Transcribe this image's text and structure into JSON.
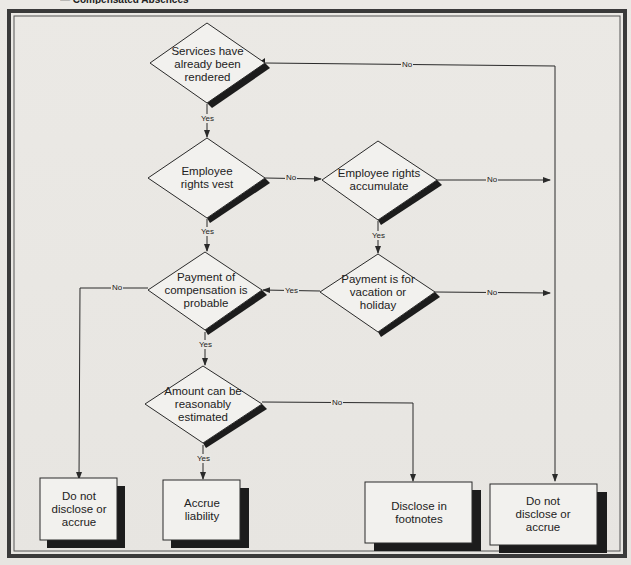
{
  "figure": {
    "title_partial": "— Compensated Absences"
  },
  "decisions": [
    {
      "id": "services-rendered",
      "label": "Services have already been rendered"
    },
    {
      "id": "rights-vest",
      "label": "Employee rights vest"
    },
    {
      "id": "rights-accumulate",
      "label": "Employee rights accumulate"
    },
    {
      "id": "vacation-holiday",
      "label": "Payment is for vacation or holiday"
    },
    {
      "id": "compensation-probable",
      "label": "Payment of compensation is probable"
    },
    {
      "id": "reasonably-estimated",
      "label": "Amount can be reasonably estimated"
    }
  ],
  "outcomes": [
    {
      "id": "do-not-disclose-left",
      "label": "Do not disclose or accrue"
    },
    {
      "id": "accrue-liability",
      "label": "Accrue liability"
    },
    {
      "id": "disclose-footnotes",
      "label": "Disclose in footnotes"
    },
    {
      "id": "do-not-disclose-right",
      "label": "Do not disclose or accrue"
    }
  ],
  "edges": [
    {
      "from": "services-rendered",
      "to": "do-not-disclose-right",
      "label": "No"
    },
    {
      "from": "services-rendered",
      "to": "rights-vest",
      "label": "Yes"
    },
    {
      "from": "rights-vest",
      "to": "rights-accumulate",
      "label": "No"
    },
    {
      "from": "rights-vest",
      "to": "compensation-probable",
      "label": "Yes"
    },
    {
      "from": "rights-accumulate",
      "to": "do-not-disclose-right",
      "label": "No"
    },
    {
      "from": "rights-accumulate",
      "to": "vacation-holiday",
      "label": "Yes"
    },
    {
      "from": "vacation-holiday",
      "to": "do-not-disclose-right",
      "label": "No"
    },
    {
      "from": "vacation-holiday",
      "to": "compensation-probable",
      "label": "Yes"
    },
    {
      "from": "compensation-probable",
      "to": "do-not-disclose-left",
      "label": "No"
    },
    {
      "from": "compensation-probable",
      "to": "reasonably-estimated",
      "label": "Yes"
    },
    {
      "from": "reasonably-estimated",
      "to": "disclose-footnotes",
      "label": "No"
    },
    {
      "from": "reasonably-estimated",
      "to": "accrue-liability",
      "label": "Yes"
    }
  ],
  "colors": {
    "background": "#e9e7e3",
    "shape_fill": "#f2f1ee",
    "stroke": "#2a2a2a",
    "shadow": "#1c1c1c",
    "frame": "#3a3a3a"
  }
}
